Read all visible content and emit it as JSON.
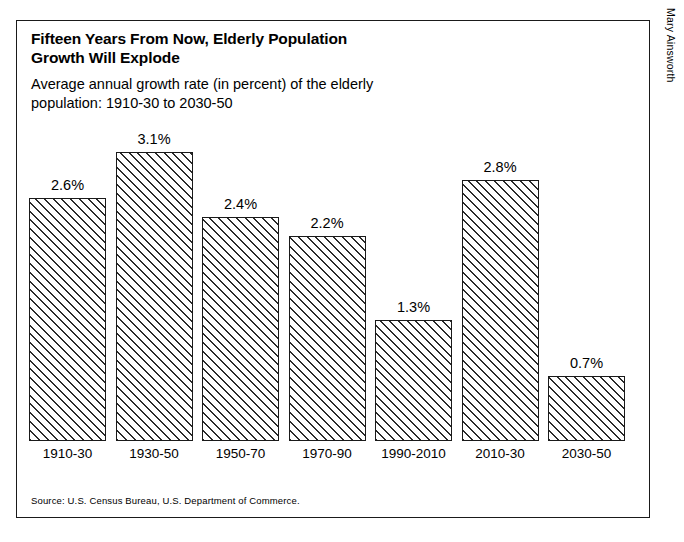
{
  "credit": "Mary Ainsworth",
  "header": {
    "title": "Fifteen Years From Now, Elderly Population\nGrowth Will Explode",
    "subtitle": "Average annual growth rate (in percent) of the elderly\npopulation:  1910-30 to 2030-50"
  },
  "footer": {
    "source": "Source:  U.S. Census Bureau, U.S. Department of Commerce."
  },
  "chart_data": {
    "type": "bar",
    "title": "Fifteen Years From Now, Elderly Population Growth Will Explode",
    "subtitle": "Average annual growth rate (in percent) of the elderly population:  1910-30 to 2030-50",
    "xlabel": "",
    "ylabel": "",
    "ylim": [
      0,
      3.5
    ],
    "grid": false,
    "legend": "none",
    "axis_visible": false,
    "orientation": "vertical",
    "bar_fill": "diagonal-hatch",
    "bar_border_color": "#1a1a1a",
    "categories": [
      "1910-30",
      "1930-50",
      "1950-70",
      "1970-90",
      "1990-2010",
      "2010-30",
      "2030-50"
    ],
    "values": [
      2.6,
      3.1,
      2.4,
      2.2,
      1.3,
      2.8,
      0.7
    ],
    "value_labels": [
      "2.6%",
      "3.1%",
      "2.4%",
      "2.2%",
      "1.3%",
      "2.8%",
      "0.7%"
    ],
    "bars": [
      {
        "category": "1910-30",
        "value": 2.6,
        "label": "2.6%"
      },
      {
        "category": "1930-50",
        "value": 3.1,
        "label": "3.1%"
      },
      {
        "category": "1950-70",
        "value": 2.4,
        "label": "2.4%"
      },
      {
        "category": "1970-90",
        "value": 2.2,
        "label": "2.2%"
      },
      {
        "category": "1990-2010",
        "value": 1.3,
        "label": "1.3%"
      },
      {
        "category": "2010-30",
        "value": 2.8,
        "label": "2.8%"
      },
      {
        "category": "2030-50",
        "value": 0.7,
        "label": "0.7%"
      }
    ]
  }
}
